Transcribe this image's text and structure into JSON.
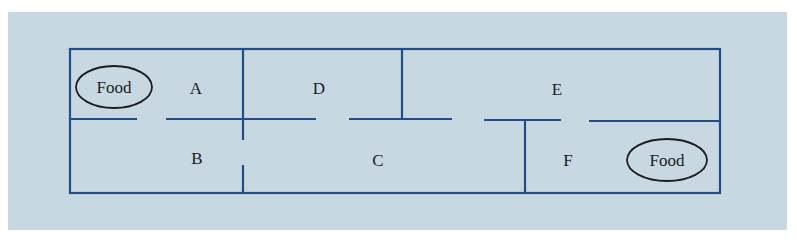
{
  "diagram": {
    "type": "floor-plan-maze",
    "colors": {
      "background": "#c8d8e3",
      "walls": "#1f4f86",
      "text": "#1c1c1c"
    },
    "rooms": [
      {
        "id": "A",
        "label": "A"
      },
      {
        "id": "B",
        "label": "B"
      },
      {
        "id": "C",
        "label": "C"
      },
      {
        "id": "D",
        "label": "D"
      },
      {
        "id": "E",
        "label": "E"
      },
      {
        "id": "F",
        "label": "F"
      }
    ],
    "food": [
      {
        "room": "A",
        "label": "Food"
      },
      {
        "room": "F",
        "label": "Food"
      }
    ]
  }
}
